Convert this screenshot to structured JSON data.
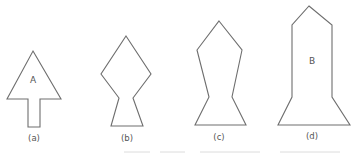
{
  "figure": {
    "background": "#ffffff",
    "stroke_color": "#6e6e6e",
    "text_color": "#555555",
    "shapes": [
      {
        "id": "a",
        "caption": "(a)",
        "inner_label": "A",
        "description": "arrow: triangle head on rectangular stem"
      },
      {
        "id": "b",
        "caption": "(b)",
        "inner_label": "",
        "description": "diamond on trapezoid base"
      },
      {
        "id": "c",
        "caption": "(c)",
        "inner_label": "",
        "description": "tall pentagon-topped shape narrowing to waist then flaring base"
      },
      {
        "id": "d",
        "caption": "(d)",
        "inner_label": "B",
        "description": "tall rocket-like shape: pointed top, long rectangular body, flared base"
      }
    ]
  }
}
